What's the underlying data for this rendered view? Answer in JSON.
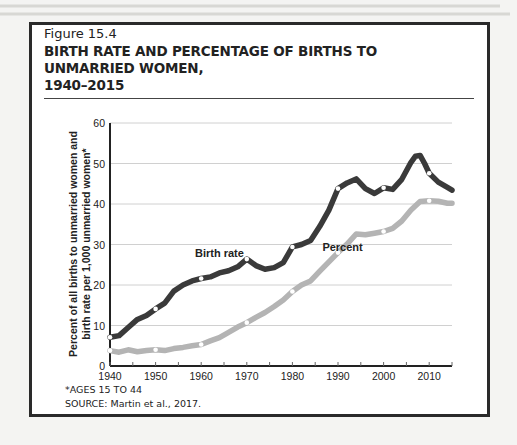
{
  "figure": {
    "label": "Figure 15.4",
    "title_line1": "BIRTH RATE AND PERCENTAGE OF BIRTHS TO UNMARRIED WOMEN,",
    "title_line2": "1940–2015",
    "footnote": "*AGES 15 TO 44",
    "source": "SOURCE: Martin et al., 2017."
  },
  "chart_data": {
    "type": "line",
    "title": "Birth Rate and Percentage of Births to Unmarried Women, 1940–2015",
    "xlabel": "",
    "ylabel_line1": "Percent of all births to unmarried women and",
    "ylabel_line2": "birth rate per 1,000 unmarried women*",
    "xlim": [
      1940,
      2015
    ],
    "ylim": [
      0,
      60
    ],
    "x_ticks": [
      1940,
      1950,
      1960,
      1970,
      1980,
      1990,
      2000,
      2010
    ],
    "y_ticks": [
      0,
      10,
      20,
      30,
      40,
      50,
      60
    ],
    "grid": "horizontal",
    "colors": {
      "birth_rate": "#3a3a3a",
      "percent": "#b4b4b4",
      "grid": "#d0d0d0",
      "axis": "#222222"
    },
    "series": [
      {
        "name": "Birth rate",
        "label_pos": {
          "year": 1964,
          "value": 27
        },
        "points": [
          [
            1940,
            7.1
          ],
          [
            1942,
            7.5
          ],
          [
            1944,
            9.5
          ],
          [
            1946,
            11.5
          ],
          [
            1948,
            12.5
          ],
          [
            1950,
            14.1
          ],
          [
            1952,
            15.5
          ],
          [
            1954,
            18.5
          ],
          [
            1956,
            20.0
          ],
          [
            1958,
            21.0
          ],
          [
            1960,
            21.6
          ],
          [
            1962,
            22.0
          ],
          [
            1964,
            23.0
          ],
          [
            1966,
            23.5
          ],
          [
            1968,
            24.5
          ],
          [
            1970,
            26.4
          ],
          [
            1972,
            24.8
          ],
          [
            1974,
            23.9
          ],
          [
            1976,
            24.3
          ],
          [
            1978,
            25.5
          ],
          [
            1980,
            29.4
          ],
          [
            1982,
            30.0
          ],
          [
            1984,
            31.0
          ],
          [
            1986,
            34.5
          ],
          [
            1988,
            38.5
          ],
          [
            1990,
            43.8
          ],
          [
            1992,
            45.2
          ],
          [
            1994,
            46.2
          ],
          [
            1996,
            43.8
          ],
          [
            1998,
            42.6
          ],
          [
            2000,
            44.0
          ],
          [
            2002,
            43.6
          ],
          [
            2004,
            46.1
          ],
          [
            2006,
            50.3
          ],
          [
            2007,
            51.8
          ],
          [
            2008,
            52.0
          ],
          [
            2009,
            50.0
          ],
          [
            2010,
            47.6
          ],
          [
            2012,
            45.4
          ],
          [
            2014,
            44.1
          ],
          [
            2015,
            43.4
          ]
        ],
        "markers": [
          1940,
          1950,
          1960,
          1970,
          1980,
          1990,
          2000,
          2010
        ]
      },
      {
        "name": "Percent",
        "label_pos": {
          "year": 1991,
          "value": 28.5
        },
        "points": [
          [
            1940,
            3.8
          ],
          [
            1942,
            3.4
          ],
          [
            1944,
            4.0
          ],
          [
            1946,
            3.5
          ],
          [
            1948,
            3.8
          ],
          [
            1950,
            4.0
          ],
          [
            1952,
            3.8
          ],
          [
            1954,
            4.3
          ],
          [
            1956,
            4.6
          ],
          [
            1958,
            5.0
          ],
          [
            1960,
            5.3
          ],
          [
            1962,
            6.2
          ],
          [
            1964,
            7.0
          ],
          [
            1966,
            8.3
          ],
          [
            1968,
            9.6
          ],
          [
            1970,
            10.7
          ],
          [
            1972,
            12.0
          ],
          [
            1974,
            13.2
          ],
          [
            1976,
            14.7
          ],
          [
            1978,
            16.3
          ],
          [
            1980,
            18.4
          ],
          [
            1982,
            20.0
          ],
          [
            1984,
            21.0
          ],
          [
            1986,
            23.4
          ],
          [
            1988,
            25.7
          ],
          [
            1990,
            28.0
          ],
          [
            1992,
            30.1
          ],
          [
            1994,
            32.6
          ],
          [
            1996,
            32.4
          ],
          [
            1998,
            32.8
          ],
          [
            2000,
            33.2
          ],
          [
            2002,
            34.0
          ],
          [
            2004,
            35.8
          ],
          [
            2006,
            38.5
          ],
          [
            2008,
            40.6
          ],
          [
            2010,
            40.8
          ],
          [
            2012,
            40.7
          ],
          [
            2014,
            40.2
          ],
          [
            2015,
            40.2
          ]
        ],
        "markers": [
          1940,
          1950,
          1960,
          1970,
          1980,
          1990,
          2000,
          2010
        ]
      }
    ]
  }
}
